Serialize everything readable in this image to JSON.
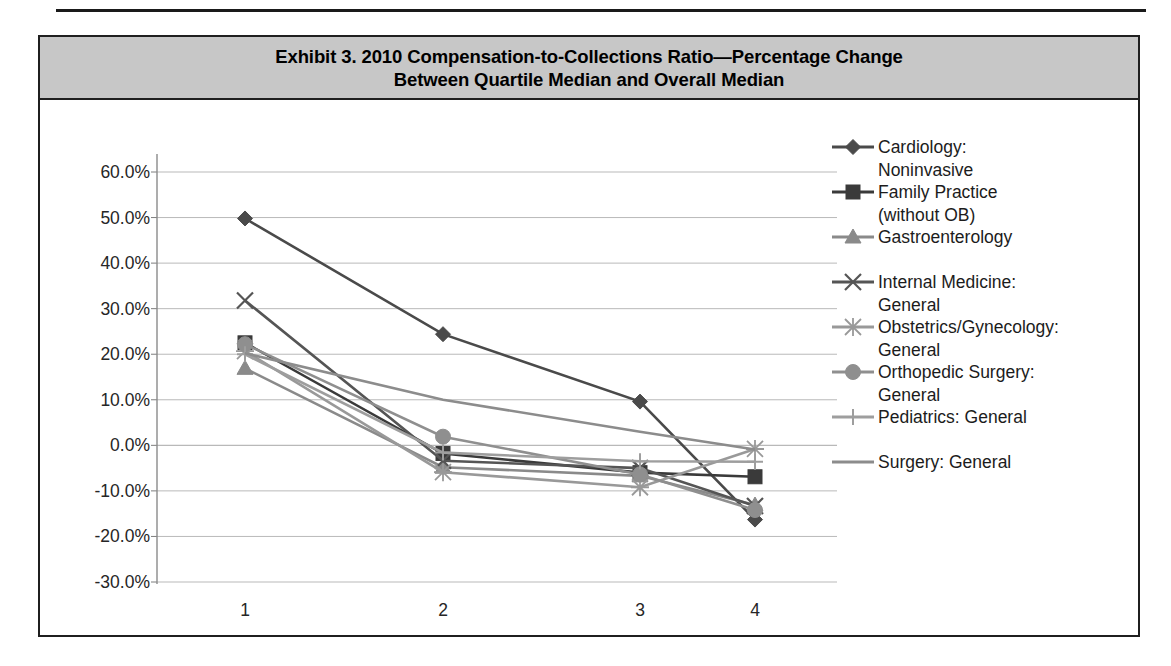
{
  "exhibit": {
    "title": "Exhibit 3. 2010 Compensation-to-Collections Ratio—Percentage Change\nBetween Quartile Median and Overall Median",
    "title_line1": "Exhibit 3. 2010 Compensation-to-Collections Ratio—Percentage Change",
    "title_line2": "Between Quartile Median and Overall Median",
    "band_color": "#c7c7c7",
    "frame_color": "#1f1f1f"
  },
  "chart_data": {
    "type": "line",
    "title": "Exhibit 3. 2010 Compensation-to-Collections Ratio—Percentage Change Between Quartile Median and Overall Median",
    "xlabel": "",
    "ylabel": "",
    "categories": [
      "1",
      "2",
      "3",
      "4"
    ],
    "x": [
      1,
      2,
      3,
      4
    ],
    "ylim": [
      -30,
      60
    ],
    "ytick_values": [
      60,
      50,
      40,
      30,
      20,
      10,
      0,
      -10,
      -20,
      -30
    ],
    "ytick_labels": [
      "60.0%",
      "50.0%",
      "40.0%",
      "30.0%",
      "20.0%",
      "10.0%",
      "0.0%",
      "-10.0%",
      "-20.0%",
      "-30.0%"
    ],
    "xtick_labels": [
      "1",
      "2",
      "3",
      "4"
    ],
    "grid": true,
    "grid_axis": "y",
    "legend_position": "right",
    "series": [
      {
        "name": "Cardiology: Noninvasive",
        "label_line1": "Cardiology:",
        "label_line2": "Noninvasive",
        "marker": "diamond",
        "color": "#4a4a4a",
        "values": [
          49.8,
          24.4,
          9.6,
          -16.3
        ]
      },
      {
        "name": "Family Practice (without OB)",
        "label_line1": "Family Practice",
        "label_line2": "(without OB)",
        "marker": "square",
        "color": "#3a3a3a",
        "values": [
          22.5,
          -1.8,
          -6.0,
          -6.9
        ]
      },
      {
        "name": "Gastroenterology",
        "label_line1": "Gastroenterology",
        "label_line2": "",
        "marker": "triangle",
        "color": "#8a8a8a",
        "values": [
          16.9,
          -4.8,
          -6.7,
          -13.1
        ]
      },
      {
        "name": "Internal Medicine: General",
        "label_line1": "Internal Medicine:",
        "label_line2": "General",
        "marker": "x",
        "color": "#555555",
        "values": [
          31.8,
          -3.4,
          -5.0,
          -13.3
        ]
      },
      {
        "name": "Obstetrics/Gynecology: General",
        "label_line1": "Obstetrics/Gynecology:",
        "label_line2": "General",
        "marker": "asterisk",
        "color": "#999999",
        "values": [
          20.7,
          -5.9,
          -9.2,
          -0.8
        ]
      },
      {
        "name": "Orthopedic Surgery: General",
        "label_line1": "Orthopedic Surgery:",
        "label_line2": "General",
        "marker": "circle",
        "color": "#8f8f8f",
        "values": [
          22.2,
          1.9,
          -6.4,
          -14.2
        ]
      },
      {
        "name": "Pediatrics: General",
        "label_line1": "Pediatrics: General",
        "label_line2": "",
        "marker": "plus",
        "color": "#9e9e9e",
        "values": [
          20.0,
          -1.6,
          -3.5,
          -3.6
        ]
      },
      {
        "name": "Surgery: General",
        "label_line1": "Surgery: General",
        "label_line2": "",
        "marker": "none",
        "color": "#8c8c8c",
        "values": [
          20.2,
          10.0,
          3.0,
          -0.9
        ]
      }
    ]
  }
}
